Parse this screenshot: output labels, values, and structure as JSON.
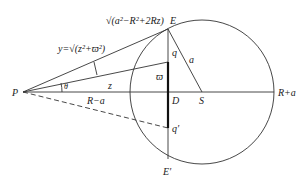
{
  "diagram": {
    "labels": {
      "P": "P",
      "E": "E",
      "E_prime": "E′",
      "D": "D",
      "S": "S",
      "q": "q",
      "q_prime": "q′",
      "a": "a",
      "z": "z",
      "theta": "θ",
      "varpi": "ϖ",
      "R_minus_a": "R−a",
      "R_plus_a": "R+a",
      "y_formula": "y=√(z²+ϖ²)",
      "E_formula": "√(a²−R²+2Rz)"
    },
    "points": {
      "P": [
        23,
        92
      ],
      "E": [
        168,
        29
      ],
      "D": [
        168,
        92
      ],
      "S": [
        202,
        92
      ],
      "q": [
        168,
        62
      ],
      "q_prime": [
        168,
        128
      ],
      "E_prime": [
        168,
        155
      ]
    },
    "circle": {
      "cx": 202,
      "cy": 92,
      "r": 72
    }
  }
}
